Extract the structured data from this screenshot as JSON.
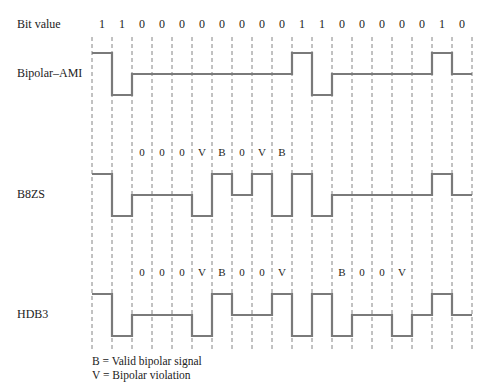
{
  "header": {
    "bit_value_label": "Bit value"
  },
  "bits": [
    "1",
    "1",
    "0",
    "0",
    "0",
    "0",
    "0",
    "0",
    "0",
    "0",
    "1",
    "1",
    "0",
    "0",
    "0",
    "0",
    "0",
    "1",
    "0"
  ],
  "signals": [
    {
      "name": "Bipolar–AMI",
      "levels": [
        1,
        -1,
        0,
        0,
        0,
        0,
        0,
        0,
        0,
        0,
        1,
        -1,
        0,
        0,
        0,
        0,
        0,
        1,
        0
      ],
      "markers": [
        "",
        "",
        "",
        "",
        "",
        "",
        "",
        "",
        "",
        "",
        "",
        "",
        "",
        "",
        "",
        "",
        "",
        "",
        ""
      ]
    },
    {
      "name": "B8ZS",
      "levels": [
        1,
        -1,
        0,
        0,
        0,
        -1,
        1,
        0,
        1,
        -1,
        1,
        -1,
        0,
        0,
        0,
        0,
        0,
        1,
        0
      ],
      "markers": [
        "",
        "",
        "0",
        "0",
        "0",
        "V",
        "B",
        "0",
        "V",
        "B",
        "",
        "",
        "",
        "",
        "",
        "",
        "",
        "",
        ""
      ]
    },
    {
      "name": "HDB3",
      "levels": [
        1,
        -1,
        0,
        0,
        0,
        -1,
        1,
        0,
        0,
        1,
        -1,
        1,
        -1,
        0,
        0,
        -1,
        0,
        1,
        0
      ],
      "markers": [
        "",
        "",
        "0",
        "0",
        "0",
        "V",
        "B",
        "0",
        "0",
        "V",
        "",
        "",
        "B",
        "0",
        "0",
        "V",
        "",
        "",
        ""
      ]
    }
  ],
  "legend": {
    "line1": "B = Valid bipolar signal",
    "line2": "V = Bipolar violation"
  },
  "style": {
    "signal_color": "#7a7a7a",
    "grid_color": "#666666"
  }
}
